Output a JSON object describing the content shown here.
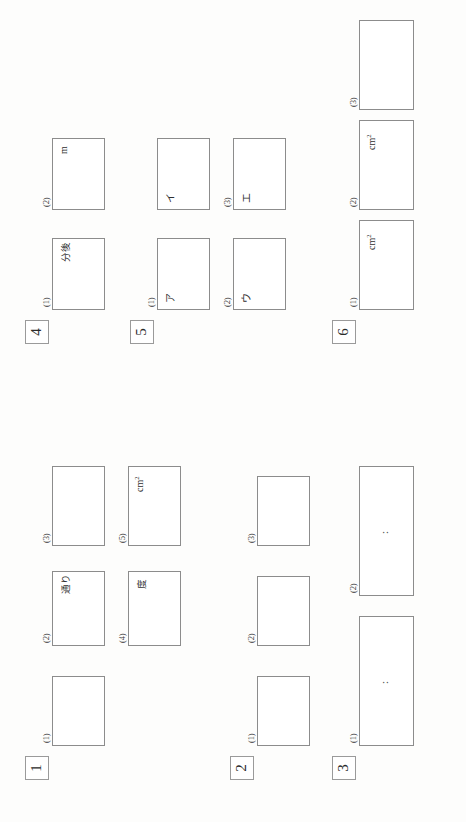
{
  "document": {
    "kind": "math-answer-sheet",
    "orientation": "rotated-90-ccw",
    "background_color": "#fdfdfc",
    "box_border_color": "#8c8c8c",
    "text_color": "#2b2b2b"
  },
  "sections": [
    {
      "number": "1",
      "boxes": [
        {
          "sublabel": "(1)",
          "unit": ""
        },
        {
          "sublabel": "(2)",
          "unit": "通り"
        },
        {
          "sublabel": "(3)",
          "unit": ""
        },
        {
          "sublabel": "(4)",
          "unit": "度"
        },
        {
          "sublabel": "(5)",
          "unit": "cm2"
        }
      ]
    },
    {
      "number": "2",
      "boxes": [
        {
          "sublabel": "(1)",
          "unit": ""
        },
        {
          "sublabel": "(2)",
          "unit": ""
        },
        {
          "sublabel": "(3)",
          "unit": ""
        }
      ]
    },
    {
      "number": "3",
      "boxes": [
        {
          "sublabel": "(1)",
          "unit": "",
          "ratio": ":"
        },
        {
          "sublabel": "(2)",
          "unit": "",
          "ratio": ":"
        }
      ]
    },
    {
      "number": "4",
      "boxes": [
        {
          "sublabel": "(1)",
          "unit": "分後"
        },
        {
          "sublabel": "(2)",
          "unit": "m"
        }
      ]
    },
    {
      "number": "5",
      "boxes": [
        {
          "sublabel": "(1)",
          "unit": "",
          "prompt": "ア"
        },
        {
          "sublabel": "",
          "unit": "",
          "prompt": "イ"
        },
        {
          "sublabel": "(2)",
          "unit": "",
          "prompt": "ウ"
        },
        {
          "sublabel": "(3)",
          "unit": "",
          "prompt": "エ"
        }
      ]
    },
    {
      "number": "6",
      "boxes": [
        {
          "sublabel": "(1)",
          "unit": "cm2"
        },
        {
          "sublabel": "(2)",
          "unit": "cm2"
        },
        {
          "sublabel": "(3)",
          "unit": ""
        }
      ]
    }
  ]
}
